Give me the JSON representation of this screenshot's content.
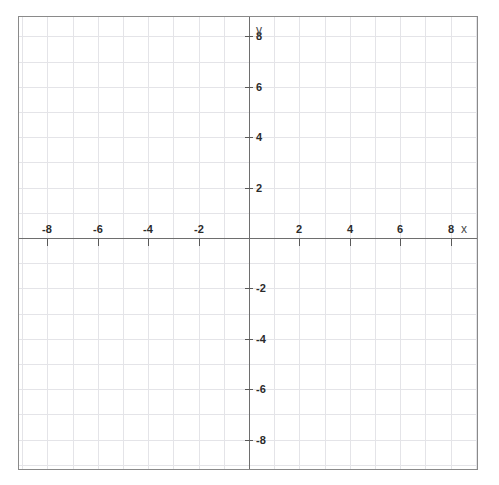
{
  "caption": {
    "text": "​"
  },
  "chart_data": {
    "type": "scatter",
    "title": "",
    "xlabel": "x",
    "ylabel": "y",
    "xlim": [
      -9.2,
      9.1
    ],
    "ylim": [
      -9.2,
      8.8
    ],
    "grid": true,
    "grid_step": 1,
    "legend": null,
    "series": [],
    "x_ticks": [
      {
        "value": -8,
        "label": "-8"
      },
      {
        "value": -6,
        "label": "-6"
      },
      {
        "value": -4,
        "label": "-4"
      },
      {
        "value": -2,
        "label": "-2"
      },
      {
        "value": 2,
        "label": "2"
      },
      {
        "value": 4,
        "label": "4"
      },
      {
        "value": 6,
        "label": "6"
      },
      {
        "value": 8,
        "label": "8"
      }
    ],
    "y_ticks": [
      {
        "value": 8,
        "label": "8"
      },
      {
        "value": 6,
        "label": "6"
      },
      {
        "value": 4,
        "label": "4"
      },
      {
        "value": 2,
        "label": "2"
      },
      {
        "value": -2,
        "label": "-2"
      },
      {
        "value": -4,
        "label": "-4"
      },
      {
        "value": -6,
        "label": "-6"
      },
      {
        "value": -8,
        "label": "-8"
      }
    ]
  },
  "geometry": {
    "origin_x": 230,
    "origin_y": 221,
    "unit_px": 25.2,
    "plot_width": 460,
    "plot_height": 454
  },
  "colors": {
    "border": "#8a8a8a",
    "grid": "#e4e4e8",
    "axis": "#6e6e6e",
    "tick": "#5a5a5a",
    "label": "#2b2b2b",
    "axis_name": "#4a4a4a",
    "background": "#ffffff"
  }
}
